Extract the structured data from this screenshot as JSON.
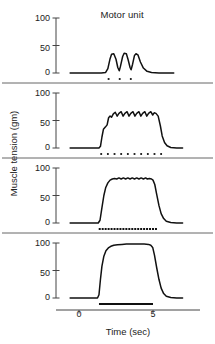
{
  "chart_data": {
    "type": "line",
    "title": "Motor unit",
    "xlabel": "Time (sec)",
    "ylabel": "Muscle tension (gm)",
    "xlim": [
      -0.8,
      7.0
    ],
    "xticks": [
      0,
      5
    ],
    "xticklabels": [
      "0",
      "5"
    ],
    "grid": false,
    "legend": null,
    "panels": [
      {
        "name": "panel-1-twitch-summation",
        "ylim": [
          0,
          100
        ],
        "yticks": [
          0,
          50,
          100
        ],
        "yticklabels": [
          "0",
          "50",
          "100"
        ],
        "peak_tension": 35,
        "baseline": 0,
        "description": "three separate twitches, no summation",
        "stimulus_count": 3,
        "stimulus_marks": [
          2.0,
          2.75,
          3.5
        ],
        "trace": [
          [
            -0.6,
            0
          ],
          [
            1.5,
            0
          ],
          [
            1.8,
            1
          ],
          [
            1.95,
            8
          ],
          [
            2.1,
            26
          ],
          [
            2.2,
            34
          ],
          [
            2.35,
            35
          ],
          [
            2.5,
            25
          ],
          [
            2.62,
            10
          ],
          [
            2.72,
            4
          ],
          [
            2.8,
            12
          ],
          [
            2.95,
            30
          ],
          [
            3.05,
            36
          ],
          [
            3.2,
            35
          ],
          [
            3.32,
            24
          ],
          [
            3.45,
            10
          ],
          [
            3.52,
            6
          ],
          [
            3.62,
            16
          ],
          [
            3.75,
            32
          ],
          [
            3.85,
            35
          ],
          [
            3.98,
            33
          ],
          [
            4.15,
            20
          ],
          [
            4.35,
            9
          ],
          [
            4.6,
            3
          ],
          [
            4.9,
            1
          ],
          [
            5.4,
            0
          ],
          [
            6.4,
            0
          ]
        ]
      },
      {
        "name": "panel-2-unfused-tetanus",
        "ylim": [
          0,
          100
        ],
        "yticks": [
          0,
          50,
          100
        ],
        "yticklabels": [
          "0",
          "50",
          "100"
        ],
        "peak_tension": 65,
        "plateau_tension": 60,
        "baseline": 0,
        "description": "unfused tetanus with visible ripple",
        "stimulus_count": 10,
        "stimulus_marks": [
          1.5,
          1.95,
          2.4,
          2.85,
          3.3,
          3.75,
          4.2,
          4.65,
          5.1,
          5.55
        ],
        "trace": [
          [
            -0.6,
            0
          ],
          [
            1.35,
            0
          ],
          [
            1.45,
            3
          ],
          [
            1.55,
            20
          ],
          [
            1.65,
            34
          ],
          [
            1.78,
            38
          ],
          [
            1.9,
            42
          ],
          [
            2.0,
            55
          ],
          [
            2.1,
            58
          ],
          [
            2.2,
            56
          ],
          [
            2.32,
            62
          ],
          [
            2.45,
            65
          ],
          [
            2.58,
            58
          ],
          [
            2.7,
            63
          ],
          [
            2.85,
            66
          ],
          [
            2.98,
            58
          ],
          [
            3.1,
            63
          ],
          [
            3.25,
            66
          ],
          [
            3.38,
            58
          ],
          [
            3.5,
            63
          ],
          [
            3.65,
            66
          ],
          [
            3.78,
            58
          ],
          [
            3.9,
            63
          ],
          [
            4.05,
            66
          ],
          [
            4.18,
            58
          ],
          [
            4.3,
            63
          ],
          [
            4.45,
            66
          ],
          [
            4.58,
            58
          ],
          [
            4.7,
            63
          ],
          [
            4.85,
            66
          ],
          [
            4.98,
            60
          ],
          [
            5.08,
            64
          ],
          [
            5.2,
            63
          ],
          [
            5.35,
            58
          ],
          [
            5.5,
            40
          ],
          [
            5.62,
            22
          ],
          [
            5.78,
            10
          ],
          [
            5.95,
            4
          ],
          [
            6.2,
            1
          ],
          [
            6.6,
            0
          ],
          [
            7.0,
            0
          ]
        ]
      },
      {
        "name": "panel-3-nearly-fused-tetanus",
        "ylim": [
          0,
          100
        ],
        "yticks": [
          0,
          50,
          100
        ],
        "yticklabels": [
          "0",
          "50",
          "100"
        ],
        "peak_tension": 82,
        "plateau_tension": 81,
        "baseline": 0,
        "description": "nearly fused tetanus, fine ripple on plateau",
        "stimulus_count": 20,
        "stimulus_marks_start": 1.4,
        "stimulus_marks_end": 5.2,
        "trace": [
          [
            -0.6,
            0
          ],
          [
            1.3,
            0
          ],
          [
            1.42,
            5
          ],
          [
            1.55,
            28
          ],
          [
            1.68,
            50
          ],
          [
            1.8,
            64
          ],
          [
            1.95,
            73
          ],
          [
            2.1,
            78
          ],
          [
            2.25,
            80
          ],
          [
            2.4,
            81
          ],
          [
            2.55,
            80
          ],
          [
            2.7,
            82
          ],
          [
            2.85,
            80
          ],
          [
            3.0,
            82
          ],
          [
            3.15,
            80
          ],
          [
            3.3,
            82
          ],
          [
            3.45,
            80
          ],
          [
            3.6,
            82
          ],
          [
            3.75,
            80
          ],
          [
            3.9,
            82
          ],
          [
            4.05,
            80
          ],
          [
            4.2,
            82
          ],
          [
            4.35,
            80
          ],
          [
            4.5,
            82
          ],
          [
            4.62,
            80
          ],
          [
            4.75,
            81
          ],
          [
            4.9,
            80
          ],
          [
            5.0,
            78
          ],
          [
            5.12,
            70
          ],
          [
            5.25,
            52
          ],
          [
            5.4,
            32
          ],
          [
            5.55,
            17
          ],
          [
            5.72,
            8
          ],
          [
            5.9,
            3
          ],
          [
            6.2,
            1
          ],
          [
            6.6,
            0
          ],
          [
            7.0,
            0
          ]
        ]
      },
      {
        "name": "panel-4-fused-tetanus",
        "ylim": [
          0,
          100
        ],
        "yticks": [
          0,
          50,
          100
        ],
        "yticklabels": [
          "0",
          "50",
          "100"
        ],
        "peak_tension": 98,
        "plateau_tension": 97,
        "baseline": 0,
        "description": "complete fused tetanus, smooth plateau",
        "stimulus_count": 1,
        "stimulus_bar_start": 1.35,
        "stimulus_bar_end": 5.0,
        "trace": [
          [
            -0.6,
            0
          ],
          [
            1.25,
            0
          ],
          [
            1.35,
            6
          ],
          [
            1.45,
            34
          ],
          [
            1.55,
            58
          ],
          [
            1.68,
            76
          ],
          [
            1.82,
            86
          ],
          [
            1.98,
            91
          ],
          [
            2.15,
            94
          ],
          [
            2.35,
            96
          ],
          [
            2.6,
            97
          ],
          [
            2.9,
            97.5
          ],
          [
            3.2,
            98
          ],
          [
            3.5,
            98
          ],
          [
            3.8,
            98
          ],
          [
            4.1,
            98
          ],
          [
            4.4,
            98
          ],
          [
            4.7,
            97.5
          ],
          [
            4.85,
            96
          ],
          [
            4.98,
            92
          ],
          [
            5.1,
            78
          ],
          [
            5.25,
            55
          ],
          [
            5.4,
            34
          ],
          [
            5.55,
            18
          ],
          [
            5.72,
            8
          ],
          [
            5.9,
            3
          ],
          [
            6.2,
            1
          ],
          [
            6.6,
            0
          ],
          [
            7.0,
            0
          ]
        ]
      }
    ]
  },
  "axis": {
    "ytick_100": "100",
    "ytick_50": "50",
    "ytick_0": "0",
    "xtick_0": "0",
    "xtick_5": "5"
  },
  "colors": {
    "trace": "#111111",
    "axis": "#444444",
    "separator": "#555555",
    "text": "#222222"
  }
}
